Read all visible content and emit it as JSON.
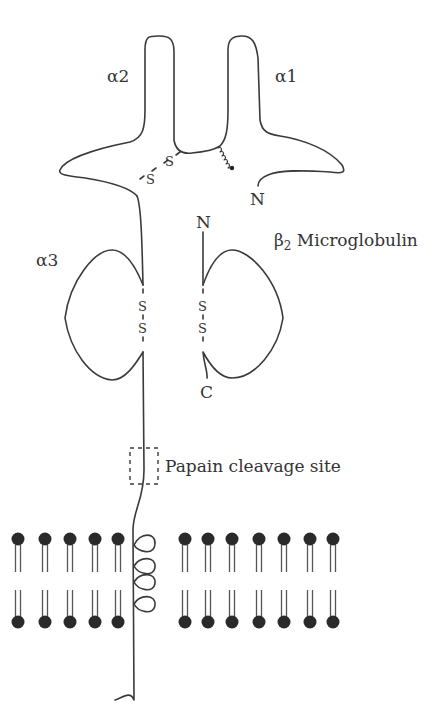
{
  "diagram": {
    "domains": {
      "alpha1": "α1",
      "alpha2": "α2",
      "alpha3": "α3",
      "beta2m_prefix": "β",
      "beta2m_sub": "2",
      "beta2m_suffix": " Microglobulin"
    },
    "termini": {
      "alpha1_n": "N",
      "beta2m_n": "N",
      "beta2m_c": "C"
    },
    "disulfide": {
      "s": "S"
    },
    "annotations": {
      "papain": "Papain cleavage site"
    },
    "membrane": {
      "left_lipid_count": 5,
      "right_lipid_count": 7
    },
    "colors": {
      "line": "#3a3a3a",
      "lipid_head": "#2a2a2a",
      "background": "#ffffff"
    }
  }
}
